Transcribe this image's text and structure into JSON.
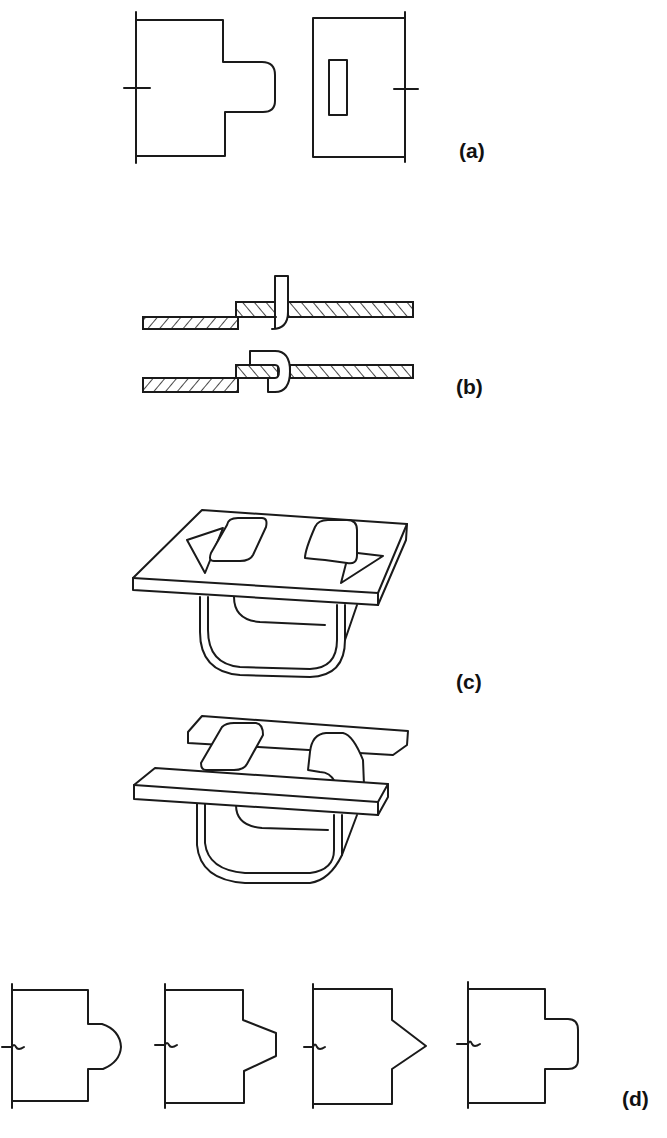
{
  "figure": {
    "panels": [
      {
        "id": "a",
        "label": "(a)",
        "content": "Flat pattern: strip with rectangular tab and mating strip with rectangular slot"
      },
      {
        "id": "b",
        "label": "(b)",
        "content": "Cross-sections: tab inserted through slot, then bent over (folded)"
      },
      {
        "id": "c",
        "label": "(c)",
        "content": "Isometric views: bracket with twisted tabs through plate; bracket with bent tabs through two bars"
      },
      {
        "id": "d",
        "label": "(d)",
        "content": "Tab shape variants: rounded, tapered trapezoid, pointed, rounded rectangle"
      }
    ]
  },
  "colors": {
    "line": "#1a1a1a",
    "background": "#ffffff",
    "hatch": "#1a1a1a"
  }
}
